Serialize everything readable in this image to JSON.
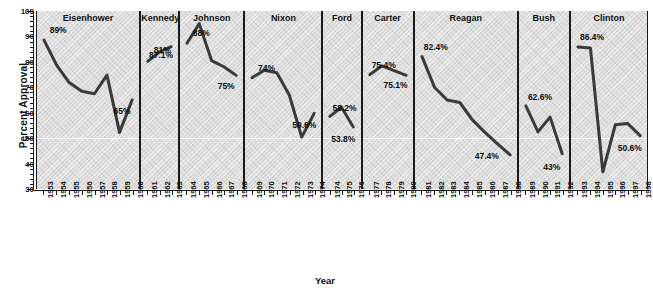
{
  "chart_data": {
    "type": "line",
    "title": "",
    "xlabel": "Year",
    "ylabel": "Percent Approval",
    "ylim": [
      30,
      100
    ],
    "yticks": [
      30,
      40,
      50,
      60,
      70,
      80,
      90,
      100
    ],
    "ytick_labels": [
      "30",
      "40",
      "50",
      "60",
      "70",
      "80",
      "90",
      "100"
    ],
    "grid": false,
    "reference_line": 50,
    "legend": "none",
    "panel_layout": "small-multiples-by-president",
    "panels": [
      {
        "name": "Eisenhower",
        "years": [
          1953,
          1954,
          1955,
          1956,
          1957,
          1958,
          1959,
          1960
        ],
        "values": [
          89,
          79,
          72,
          68.5,
          67.5,
          75,
          52,
          65
        ],
        "annotations": [
          {
            "text": "89%",
            "year": 1953,
            "value": 89
          },
          {
            "text": "65%",
            "year": 1960,
            "value": 65
          }
        ]
      },
      {
        "name": "Kennedy",
        "years": [
          1961,
          1962,
          1963
        ],
        "values": [
          81,
          85,
          87.1
        ],
        "annotations": [
          {
            "text": "81%",
            "year": 1961,
            "value": 81
          },
          {
            "text": "87.1%",
            "year": 1963,
            "value": 87.1
          }
        ]
      },
      {
        "name": "Johnson",
        "years": [
          1964,
          1965,
          1966,
          1967,
          1968
        ],
        "values": [
          88,
          96,
          81,
          78.5,
          75
        ],
        "annotations": [
          {
            "text": "88%",
            "year": 1964,
            "value": 88
          },
          {
            "text": "75%",
            "year": 1968,
            "value": 75
          }
        ]
      },
      {
        "name": "Nixon",
        "years": [
          1969,
          1970,
          1971,
          1972,
          1973,
          1974
        ],
        "values": [
          74,
          77,
          76,
          67,
          50,
          59.6
        ],
        "annotations": [
          {
            "text": "74%",
            "year": 1969,
            "value": 74
          },
          {
            "text": "59.6%",
            "year": 1974,
            "value": 59.6
          }
        ]
      },
      {
        "name": "Ford",
        "years": [
          1974,
          1975,
          1976
        ],
        "values": [
          58.2,
          62,
          53.8
        ],
        "annotations": [
          {
            "text": "58.2%",
            "year": 1974,
            "value": 58.2
          },
          {
            "text": "53.8%",
            "year": 1976,
            "value": 53.8
          }
        ]
      },
      {
        "name": "Carter",
        "years": [
          1977,
          1978,
          1979,
          1980
        ],
        "values": [
          75.4,
          79,
          77,
          75.1
        ],
        "annotations": [
          {
            "text": "75.4%",
            "year": 1977,
            "value": 75.4
          },
          {
            "text": "75.1%",
            "year": 1980,
            "value": 75.1
          }
        ]
      },
      {
        "name": "Reagan",
        "years": [
          1981,
          1982,
          1983,
          1984,
          1985,
          1986,
          1987,
          1988
        ],
        "values": [
          82.4,
          70,
          65,
          64,
          57,
          52,
          47.4,
          43
        ],
        "annotations": [
          {
            "text": "82.4%",
            "year": 1981,
            "value": 82.4
          },
          {
            "text": "47.4%",
            "year": 1987,
            "value": 47.4
          }
        ]
      },
      {
        "name": "Bush",
        "years": [
          1989,
          1990,
          1991,
          1992
        ],
        "values": [
          62.6,
          52,
          58,
          43
        ],
        "annotations": [
          {
            "text": "62.6%",
            "year": 1989,
            "value": 62.6
          },
          {
            "text": "43%",
            "year": 1992,
            "value": 43
          }
        ]
      },
      {
        "name": "Clinton",
        "years": [
          1993,
          1994,
          1995,
          1996,
          1997,
          1998
        ],
        "values": [
          86.4,
          86,
          36,
          55,
          55.5,
          50.6
        ],
        "annotations": [
          {
            "text": "86.4%",
            "year": 1993,
            "value": 86.4
          },
          {
            "text": "50.6%",
            "year": 1998,
            "value": 50.6
          }
        ]
      }
    ],
    "xtick_labels": [
      "1953",
      "1954",
      "1955",
      "1956",
      "1957",
      "1958",
      "1959",
      "1960",
      "1961",
      "1962",
      "1963",
      "1964",
      "1965",
      "1966",
      "1967",
      "1968",
      "1969",
      "1970",
      "1971",
      "1972",
      "1973",
      "1974",
      "1974",
      "1975",
      "1976",
      "1977",
      "1978",
      "1979",
      "1980",
      "1981",
      "1982",
      "1983",
      "1984",
      "1985",
      "1986",
      "1987",
      "1988",
      "1989",
      "1990",
      "1991",
      "1992",
      "1993",
      "1994",
      "1995",
      "1996",
      "1997",
      "1998"
    ],
    "colors": {
      "line": "#3a3a3a",
      "panel_background": "#dcdcdc",
      "axis": "#1a1a1a",
      "reference_line": "#ffffff",
      "text": "#111111"
    }
  }
}
